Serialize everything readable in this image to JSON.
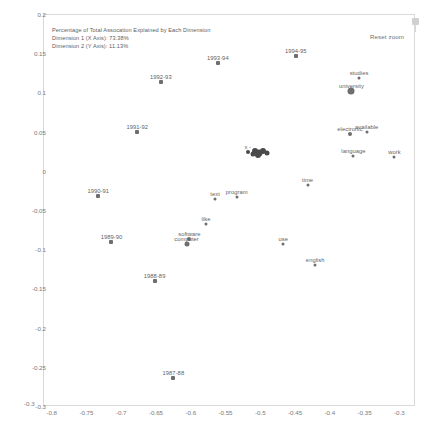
{
  "annotation": {
    "title": "Percentage of Total Assocation Explained by Each Dimension",
    "dim1": "Dimension 1 (X Axis): 73.38%",
    "dim2": "Dimension 2 (Y Axis): 11.13%"
  },
  "controls": {
    "reset_zoom_label": "Reset zoom"
  },
  "footer_text": "",
  "chart_data": {
    "type": "scatter",
    "title": "Percentage of Total Assocation Explained by Each Dimension",
    "xlabel": "",
    "ylabel": "",
    "xlim": [
      -0.8125,
      -0.2775
    ],
    "ylim": [
      -0.3,
      0.2
    ],
    "grid": false,
    "legend": "none",
    "xticks": [
      -0.8,
      -0.75,
      -0.7,
      -0.65,
      -0.6,
      -0.55,
      -0.5,
      -0.45,
      -0.4,
      -0.35,
      -0.3
    ],
    "yticks": [
      0.2,
      0.15,
      0.1,
      0.05,
      0,
      -0.05,
      -0.1,
      -0.15,
      -0.2,
      -0.25,
      -0.3
    ],
    "xtick_labels": [
      "-0.8",
      "-0.75",
      "-0.7",
      "-0.65",
      "-0.6",
      "-0.55",
      "-0.5",
      "-0.45",
      "-0.4",
      "-0.35",
      "-0.3"
    ],
    "ytick_labels": [
      "0.2",
      "0.15",
      "0.1",
      "0.05",
      "0",
      "-0.05",
      "-0.1",
      "-0.15",
      "-0.2",
      "-0.25",
      "-0.3"
    ],
    "series": [
      {
        "name": "years",
        "points": [
          {
            "label": "1994-95",
            "x": -0.449,
            "y": 0.147,
            "size": 4
          },
          {
            "label": "1993-94",
            "x": -0.561,
            "y": 0.137,
            "size": 4
          },
          {
            "label": "1992-93",
            "x": -0.643,
            "y": 0.113,
            "size": 4
          },
          {
            "label": "1991-92",
            "x": -0.677,
            "y": 0.049,
            "size": 4
          },
          {
            "label": "1990-91",
            "x": -0.733,
            "y": -0.032,
            "size": 4
          },
          {
            "label": "1989-90",
            "x": -0.714,
            "y": -0.091,
            "size": 4
          },
          {
            "label": "1988-89",
            "x": -0.652,
            "y": -0.141,
            "size": 4
          },
          {
            "label": "1987-88",
            "x": -0.625,
            "y": -0.264,
            "size": 4
          }
        ]
      },
      {
        "name": "terms",
        "points": [
          {
            "label": "studies",
            "x": -0.358,
            "y": 0.118,
            "size": 3
          },
          {
            "label": "university",
            "x": -0.369,
            "y": 0.102,
            "size": 7
          },
          {
            "label": "available",
            "x": -0.347,
            "y": 0.05,
            "size": 3
          },
          {
            "label": "electronic",
            "x": -0.371,
            "y": 0.047,
            "size": 4
          },
          {
            "label": "language",
            "x": -0.366,
            "y": 0.019,
            "size": 3
          },
          {
            "label": "work",
            "x": -0.307,
            "y": 0.018,
            "size": 3
          },
          {
            "label": "time",
            "x": -0.432,
            "y": -0.018,
            "size": 3
          },
          {
            "label": "text",
            "x": -0.565,
            "y": -0.036,
            "size": 3
          },
          {
            "label": "program",
            "x": -0.534,
            "y": -0.034,
            "size": 3
          },
          {
            "label": "like",
            "x": -0.578,
            "y": -0.068,
            "size": 3
          },
          {
            "label": "software",
            "x": -0.602,
            "y": -0.087,
            "size": 4
          },
          {
            "label": "computer",
            "x": -0.606,
            "y": -0.093,
            "size": 5
          },
          {
            "label": "use",
            "x": -0.467,
            "y": -0.093,
            "size": 3
          },
          {
            "label": "english",
            "x": -0.421,
            "y": -0.12,
            "size": 3
          }
        ]
      },
      {
        "name": "dense-cluster",
        "points": [
          {
            "label": "x -",
            "x": -0.518,
            "y": 0.024,
            "size": 4
          },
          {
            "label": "",
            "x": -0.508,
            "y": 0.0255,
            "size": 6
          },
          {
            "label": "",
            "x": -0.502,
            "y": 0.023,
            "size": 7
          },
          {
            "label": "",
            "x": -0.496,
            "y": 0.025,
            "size": 6
          },
          {
            "label": "",
            "x": -0.504,
            "y": 0.02,
            "size": 6
          },
          {
            "label": "",
            "x": -0.49,
            "y": 0.023,
            "size": 5
          },
          {
            "label": "",
            "x": -0.511,
            "y": 0.0215,
            "size": 5
          }
        ]
      }
    ]
  }
}
